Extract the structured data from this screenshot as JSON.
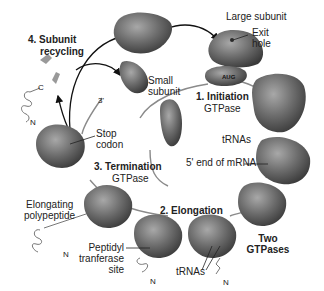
{
  "diagram": {
    "steps": [
      {
        "number": "1.",
        "name": "Initiation",
        "sub": "GTPase"
      },
      {
        "number": "2.",
        "name": "Elongation",
        "sub": ""
      },
      {
        "number": "3.",
        "name": "Termination",
        "sub": "GTPase"
      },
      {
        "number": "4.",
        "name": "Subunit",
        "sub": "recycling"
      }
    ],
    "labels": {
      "large_subunit": "Large subunit",
      "exit_hole_1": "Exit",
      "exit_hole_2": "hole",
      "small_subunit_1": "Small",
      "small_subunit_2": "subunit",
      "aug": "AUG",
      "init_title": "1. Initiation",
      "init_sub": "GTPase",
      "trnas_top": "tRNAs",
      "five_prime": "5' end of mRNA",
      "three_prime": "3'",
      "stop_1": "Stop",
      "stop_2": "codon",
      "term_title": "3. Termination",
      "term_sub": "GTPase",
      "recycle_1": "4. Subunit",
      "recycle_2": "recycling",
      "elong_poly_1": "Elongating",
      "elong_poly_2": "polypeptide",
      "elong_title": "2. Elongation",
      "two_gtp_1": "Two",
      "two_gtp_2": "GTPases",
      "peptidyl_1": "Peptidyl",
      "peptidyl_2": "tranferase",
      "peptidyl_3": "site",
      "trnas_bottom": "tRNAs",
      "c_term": "C",
      "n_term_1": "N",
      "n_term_2": "N",
      "n_term_3": "N",
      "n_term_4": "N"
    },
    "colors": {
      "ribosome": "#6e6e6e",
      "ribosome_light": "#9a9a9a",
      "ribosome_dark": "#3e3e3e",
      "mrna": "#8a8a8a",
      "arrow": "#111111"
    }
  }
}
